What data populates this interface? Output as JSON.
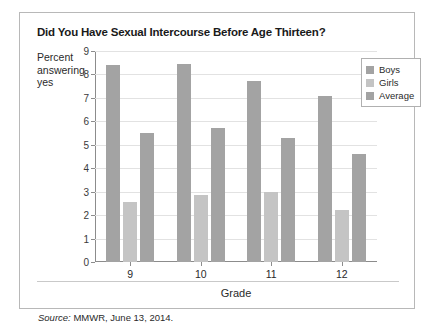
{
  "figure": {
    "title": "Did You Have Sexual Intercourse Before Age Thirteen?",
    "source_word": "Source:",
    "source_text": " MMWR, June 13, 2014."
  },
  "colors": {
    "boys": "#a3a3a3",
    "girls": "#c4c4c4",
    "average": "#a3a3a3",
    "frame": "#b8b8b8",
    "axis": "#8c8c8c",
    "grid": "#e2e2e2"
  },
  "chart_data": {
    "type": "bar",
    "title": "Did You Have Sexual Intercourse Before Age Thirteen?",
    "xlabel": "Grade",
    "ylabel": "Percent answering yes",
    "categories": [
      "9",
      "10",
      "11",
      "12"
    ],
    "yticks": [
      "0",
      "1",
      "2",
      "3",
      "4",
      "5",
      "6",
      "7",
      "8",
      "9"
    ],
    "ylim": [
      0,
      9
    ],
    "grid": true,
    "legend_position": "top-right",
    "series": [
      {
        "name": "Boys",
        "color": "#a3a3a3",
        "values": [
          8.4,
          8.45,
          7.7,
          7.1
        ]
      },
      {
        "name": "Girls",
        "color": "#c4c4c4",
        "values": [
          2.55,
          2.85,
          3.0,
          2.2
        ]
      },
      {
        "name": "Average",
        "color": "#a3a3a3",
        "values": [
          5.5,
          5.7,
          5.3,
          4.6
        ]
      }
    ]
  }
}
